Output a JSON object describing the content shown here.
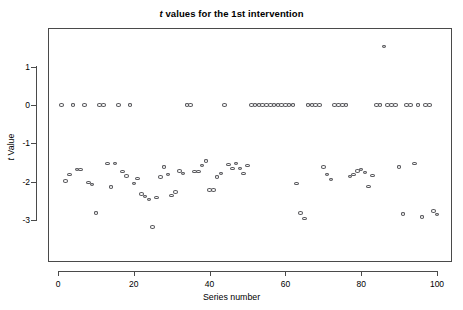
{
  "chart_data": {
    "type": "scatter",
    "title": "t values for the 1st intervention",
    "title_leading_italic": "t",
    "title_rest": " values for the 1st intervention",
    "xlabel": "Series number",
    "ylabel": "t Value",
    "ylabel_leading_italic": "t",
    "ylabel_rest": " Value",
    "xlim": [
      0,
      103
    ],
    "ylim": [
      -3.35,
      1.75
    ],
    "xticks": [
      0,
      20,
      40,
      60,
      80,
      100
    ],
    "xtick_labels": [
      "0",
      "20",
      "40",
      "60",
      "80",
      "100"
    ],
    "yticks": [
      1,
      0,
      -1,
      -2,
      -3
    ],
    "ytick_labels": [
      "1",
      "0",
      "-1",
      "-2",
      "-3"
    ],
    "grid": false,
    "legend": false,
    "marker": "open-circle",
    "marker_color": "#58585c",
    "n_points": 100,
    "x": [
      1,
      2,
      3,
      4,
      5,
      6,
      7,
      8,
      9,
      10,
      11,
      12,
      13,
      14,
      15,
      16,
      17,
      18,
      19,
      20,
      21,
      22,
      23,
      24,
      25,
      26,
      27,
      28,
      29,
      30,
      31,
      32,
      33,
      34,
      35,
      36,
      37,
      38,
      39,
      40,
      41,
      42,
      43,
      44,
      45,
      46,
      47,
      48,
      49,
      50,
      51,
      52,
      53,
      54,
      55,
      56,
      57,
      58,
      59,
      60,
      61,
      62,
      63,
      64,
      65,
      66,
      67,
      68,
      69,
      70,
      71,
      72,
      73,
      74,
      75,
      76,
      77,
      78,
      79,
      80,
      81,
      82,
      83,
      84,
      85,
      86,
      87,
      88,
      89,
      90,
      91,
      92,
      93,
      94,
      95,
      96,
      97,
      98,
      99,
      100
    ],
    "y": [
      0,
      -1.98,
      -1.82,
      0,
      -1.68,
      -1.68,
      0,
      -2.02,
      -2.08,
      -2.82,
      0,
      0,
      -1.52,
      -2.14,
      -1.52,
      0,
      -1.73,
      -1.85,
      0,
      -2.05,
      -1.92,
      -2.32,
      -2.38,
      -2.46,
      -3.18,
      -2.41,
      -1.88,
      -1.62,
      -1.82,
      -2.36,
      -2.27,
      -1.72,
      -1.78,
      0,
      0,
      -1.74,
      -1.74,
      -1.58,
      -1.46,
      -2.22,
      -2.22,
      -1.88,
      -1.78,
      0,
      -1.55,
      -1.66,
      -1.52,
      -1.65,
      -1.78,
      -1.58,
      0,
      0,
      0,
      0,
      0,
      0,
      0,
      0,
      0,
      0,
      0,
      0,
      -2.04,
      -2.82,
      -2.96,
      0,
      0,
      0,
      0,
      -1.62,
      -1.82,
      -1.94,
      0,
      0,
      0,
      0,
      -1.86,
      -1.82,
      -1.72,
      -1.68,
      -1.76,
      -2.12,
      -1.84,
      0,
      0,
      1.52,
      0,
      0,
      0,
      -1.62,
      -2.84,
      0,
      0,
      -1.52,
      0,
      -2.92,
      0,
      0,
      -2.76,
      -2.86
    ],
    "series_at_zero_count": 45,
    "outlier": {
      "x": 86,
      "y": 1.52
    }
  }
}
